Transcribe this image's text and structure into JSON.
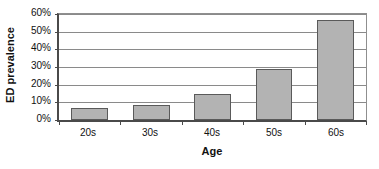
{
  "chart_data": {
    "type": "bar",
    "title": "",
    "xlabel": "Age",
    "ylabel": "ED prevalence",
    "categories": [
      "20s",
      "30s",
      "40s",
      "50s",
      "60s"
    ],
    "values": [
      7,
      8.5,
      15,
      29,
      56.5
    ],
    "value_labels": [
      "7%",
      "8.5%",
      "15%",
      "29%",
      "56.5%"
    ],
    "ylim": [
      0,
      60
    ],
    "ytick_labels": [
      "0%",
      "10%",
      "20%",
      "30%",
      "40%",
      "50%",
      "60%"
    ],
    "ytick_values": [
      0,
      10,
      20,
      30,
      40,
      50,
      60
    ],
    "grid": true,
    "legend": false,
    "series": [
      {
        "name": "ED prevalence",
        "values": [
          7,
          8.5,
          15,
          29,
          56.5
        ]
      }
    ],
    "colors": {
      "bar_fill": "#b3b3b3",
      "bar_border": "#5a5a5a",
      "gridline": "#8a8a8a",
      "axis": "#4a4a4a",
      "background": "#ffffff",
      "text": "#111111"
    }
  }
}
